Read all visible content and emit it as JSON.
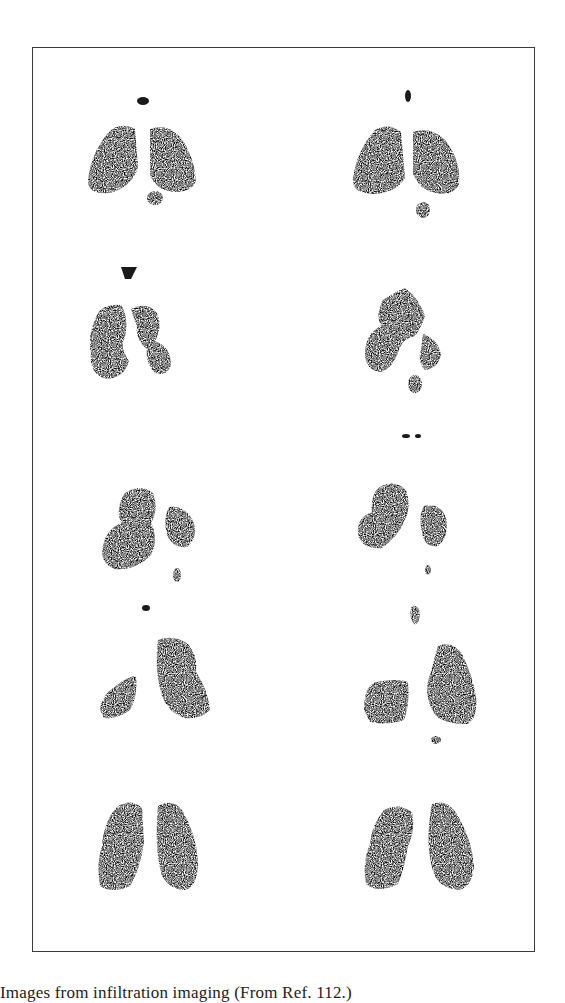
{
  "figure": {
    "type": "scintigraphy-image-grid",
    "rows": 5,
    "columns": 2,
    "panels": [
      {
        "row": 1,
        "col": 1,
        "label": "lung-scan-r1-c1"
      },
      {
        "row": 1,
        "col": 2,
        "label": "lung-scan-r1-c2"
      },
      {
        "row": 2,
        "col": 1,
        "label": "lung-scan-r2-c1"
      },
      {
        "row": 2,
        "col": 2,
        "label": "lung-scan-r2-c2"
      },
      {
        "row": 3,
        "col": 1,
        "label": "lung-scan-r3-c1"
      },
      {
        "row": 3,
        "col": 2,
        "label": "lung-scan-r3-c2"
      },
      {
        "row": 4,
        "col": 1,
        "label": "lung-scan-r4-c1"
      },
      {
        "row": 4,
        "col": 2,
        "label": "lung-scan-r4-c2"
      },
      {
        "row": 5,
        "col": 1,
        "label": "lung-scan-r5-c1"
      },
      {
        "row": 5,
        "col": 2,
        "label": "lung-scan-r5-c2"
      }
    ],
    "colors": {
      "ink": "#0d0d0d",
      "border": "#3a3a3a",
      "background": "#ffffff"
    }
  },
  "caption": {
    "text": "Images from infiltration imaging (From Ref. 112.)"
  }
}
